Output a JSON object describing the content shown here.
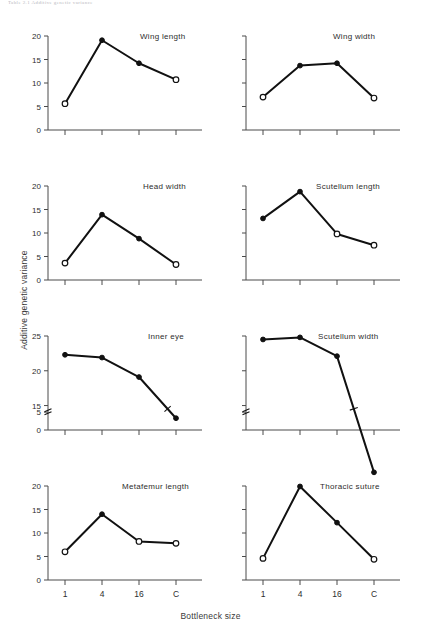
{
  "header": {
    "running_head": "Table 2.1 Additive genetic variance"
  },
  "axes": {
    "ylabel": "Additive genetic variance",
    "xlabel": "Bottleneck size",
    "x_categories": [
      "1",
      "4",
      "16",
      "C"
    ]
  },
  "chart_data": [
    {
      "type": "line",
      "title": "Wing length",
      "panel": "top-left",
      "categories": [
        "1",
        "4",
        "16",
        "C"
      ],
      "values": [
        5.6,
        19.1,
        14.2,
        10.7
      ],
      "markers": [
        "open",
        "filled",
        "filled",
        "open"
      ],
      "xlabel": "Bottleneck size",
      "ylabel": "Additive genetic variance",
      "ylim": [
        0,
        20
      ],
      "yticks": [
        0,
        5,
        10,
        15,
        20
      ],
      "ytick_labels": [
        "0",
        "5",
        "10",
        "15",
        "20"
      ],
      "axis_break": false,
      "grid": false,
      "legend": "none"
    },
    {
      "type": "line",
      "title": "Wing width",
      "panel": "top-right",
      "categories": [
        "1",
        "4",
        "16",
        "C"
      ],
      "values": [
        7.0,
        13.7,
        14.2,
        6.8
      ],
      "markers": [
        "open",
        "filled",
        "filled",
        "open"
      ],
      "xlabel": "Bottleneck size",
      "ylabel": "Additive genetic variance",
      "ylim": [
        0,
        20
      ],
      "yticks": [
        0,
        5,
        10,
        15,
        20
      ],
      "ytick_labels": [
        "",
        "",
        "",
        "",
        ""
      ],
      "axis_break": false,
      "grid": false,
      "legend": "none"
    },
    {
      "type": "line",
      "title": "Head width",
      "panel": "second-left",
      "categories": [
        "1",
        "4",
        "16",
        "C"
      ],
      "values": [
        3.6,
        13.9,
        8.8,
        3.3
      ],
      "markers": [
        "open",
        "filled",
        "filled",
        "open"
      ],
      "xlabel": "Bottleneck size",
      "ylabel": "Additive genetic variance",
      "ylim": [
        0,
        20
      ],
      "yticks": [
        0,
        5,
        10,
        15,
        20
      ],
      "ytick_labels": [
        "0",
        "5",
        "10",
        "15",
        "20"
      ],
      "axis_break": false,
      "grid": false,
      "legend": "none"
    },
    {
      "type": "line",
      "title": "Scutellum length",
      "panel": "second-right",
      "categories": [
        "1",
        "4",
        "16",
        "C"
      ],
      "values": [
        13.1,
        18.8,
        9.8,
        7.4
      ],
      "markers": [
        "filled",
        "filled",
        "open",
        "open"
      ],
      "xlabel": "Bottleneck size",
      "ylabel": "Additive genetic variance",
      "ylim": [
        0,
        20
      ],
      "yticks": [
        0,
        5,
        10,
        15,
        20
      ],
      "ytick_labels": [
        "",
        "",
        "",
        "",
        ""
      ],
      "axis_break": false,
      "grid": false,
      "legend": "none"
    },
    {
      "type": "line",
      "title": "Inner eye",
      "panel": "third-left",
      "categories": [
        "1",
        "4",
        "16",
        "C"
      ],
      "values": [
        22.3,
        21.9,
        19.1,
        3.3
      ],
      "markers": [
        "filled",
        "filled",
        "filled",
        "filled"
      ],
      "xlabel": "Bottleneck size",
      "ylabel": "Additive genetic variance",
      "ylim": [
        0,
        25
      ],
      "yticks": [
        0,
        5,
        15,
        20,
        25
      ],
      "ytick_labels": [
        "0",
        "5",
        "15",
        "20",
        "25"
      ],
      "axis_break": true,
      "axis_break_between": [
        5,
        15
      ],
      "grid": false,
      "legend": "none"
    },
    {
      "type": "line",
      "title": "Scutellum width",
      "panel": "third-right",
      "categories": [
        "1",
        "4",
        "16",
        "C"
      ],
      "values": [
        24.5,
        24.8,
        22.1,
        5.4
      ],
      "markers": [
        "filled",
        "filled",
        "filled",
        "filled"
      ],
      "xlabel": "Bottleneck size",
      "ylabel": "Additive genetic variance",
      "ylim": [
        0,
        25
      ],
      "yticks": [
        0,
        5,
        15,
        20,
        25
      ],
      "ytick_labels": [
        "",
        "",
        "",
        "",
        ""
      ],
      "axis_break": true,
      "axis_break_between": [
        5,
        15
      ],
      "grid": false,
      "legend": "none"
    },
    {
      "type": "line",
      "title": "Metafemur length",
      "panel": "bottom-left",
      "categories": [
        "1",
        "4",
        "16",
        "C"
      ],
      "values": [
        6.0,
        14.0,
        8.2,
        7.8
      ],
      "markers": [
        "open",
        "filled",
        "open",
        "open"
      ],
      "xlabel": "Bottleneck size",
      "ylabel": "Additive genetic variance",
      "ylim": [
        0,
        20
      ],
      "yticks": [
        0,
        5,
        10,
        15,
        20
      ],
      "ytick_labels": [
        "0",
        "5",
        "10",
        "15",
        "20"
      ],
      "axis_break": false,
      "grid": false,
      "legend": "none"
    },
    {
      "type": "line",
      "title": "Thoracic suture",
      "panel": "bottom-right",
      "categories": [
        "1",
        "4",
        "16",
        "C"
      ],
      "values": [
        4.6,
        19.9,
        12.2,
        4.4
      ],
      "markers": [
        "open",
        "filled",
        "filled",
        "open"
      ],
      "xlabel": "Bottleneck size",
      "ylabel": "Additive genetic variance",
      "ylim": [
        0,
        20
      ],
      "yticks": [
        0,
        5,
        10,
        15,
        20
      ],
      "ytick_labels": [
        "",
        "",
        "",
        "",
        ""
      ],
      "axis_break": false,
      "grid": false,
      "legend": "none"
    }
  ]
}
